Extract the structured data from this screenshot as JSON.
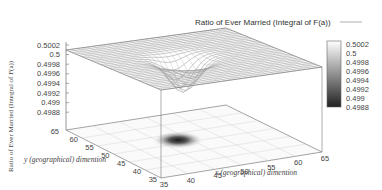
{
  "chart_data": {
    "type": "surface3d",
    "title": "Ratio of Ever Married (Integral of F(a))",
    "legend": {
      "label": "Ratio of Ever Married (Integral of F(a))",
      "position": "top-right",
      "line_color": "#999999"
    },
    "xlabel": "x (geographical) dimention",
    "ylabel": "y (geographical) dimention",
    "zlabel": "Ratio of Ever Married (Integral of F(a))",
    "x_ticks": [
      "35",
      "40",
      "45",
      "50",
      "55",
      "60",
      "65"
    ],
    "y_ticks": [
      "35",
      "40",
      "45",
      "50",
      "55",
      "60",
      "65"
    ],
    "z_ticks": [
      "0.5002",
      "0.5",
      "0.4998",
      "0.4996",
      "0.4994",
      "0.4992",
      "0.499",
      "0.4988"
    ],
    "xlim": [
      35,
      65
    ],
    "ylim": [
      35,
      65
    ],
    "zlim": [
      0.4988,
      0.5002
    ],
    "colorbox": {
      "ticks": [
        "0.5002",
        "0.5",
        "0.4998",
        "0.4996",
        "0.4994",
        "0.4992",
        "0.499",
        "0.4988"
      ],
      "low_color": "#222222",
      "high_color": "#ffffff"
    },
    "surface": {
      "baseline": 0.5,
      "dip_center": {
        "x": 48,
        "y": 50
      },
      "dip_min": 0.4988,
      "description": "Flat plane at 0.5 with a single localized Gaussian-shaped depression near x≈48, y≈50"
    },
    "projection_heatmap": {
      "dark_spot_center": {
        "x": 48,
        "y": 50
      },
      "color_scale": "gray"
    }
  }
}
